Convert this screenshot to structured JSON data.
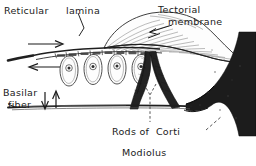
{
  "figure": {
    "background_color": "#ffffff",
    "ink_color": "#1a1a1a",
    "labels": {
      "reticular": "Reticular",
      "lamina": "lamina",
      "tectorial_line1": "Tectorial",
      "tectorial_line2": "membrane",
      "basilar_line1": "Basilar",
      "basilar_line2": "fiber",
      "rods_of_corti": "Rods of  Corti",
      "modiolus": "Modiolus"
    },
    "structures": {
      "tectorial_membrane": "striated tapering flap",
      "reticular_lamina": "segmented plate",
      "hair_cells_count": 4,
      "rods_of_corti": "dark inverted-V arch",
      "basilar_fiber": "thin horizontal line",
      "modiolus": "solid black trumpet"
    },
    "arrows": {
      "shear_right": "rightward arrow",
      "shear_left": "leftward arrow",
      "basilar_down": "downward arrow",
      "basilar_up": "upward arrow",
      "tectorial_pointer": "leftward pointer arrow"
    }
  }
}
